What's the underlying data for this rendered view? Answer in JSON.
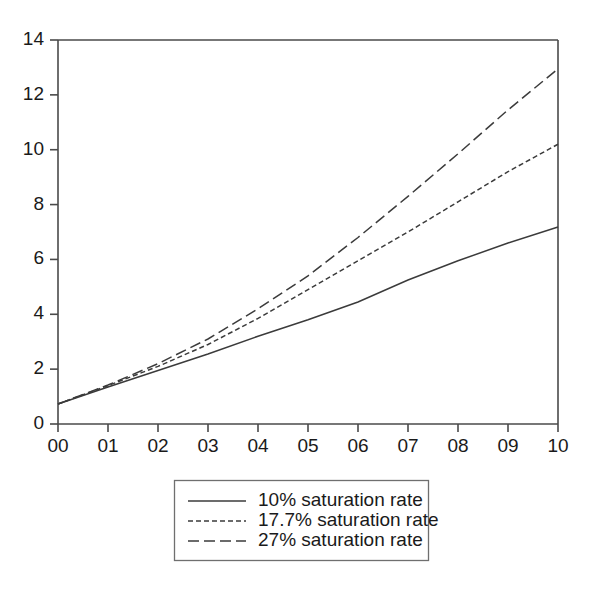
{
  "chart_data": {
    "type": "line",
    "title": "",
    "subtitle": "",
    "xlabel": "",
    "ylabel": "",
    "x": [
      0,
      1,
      2,
      3,
      4,
      5,
      6,
      7,
      8,
      9,
      10
    ],
    "xtick_labels": [
      "00",
      "01",
      "02",
      "03",
      "04",
      "05",
      "06",
      "07",
      "08",
      "09",
      "10"
    ],
    "ytick_labels": [
      "0",
      "2",
      "4",
      "6",
      "8",
      "10",
      "12",
      "14"
    ],
    "yticks": [
      0,
      2,
      4,
      6,
      8,
      10,
      12,
      14
    ],
    "xlim": [
      0,
      10
    ],
    "ylim": [
      0,
      14
    ],
    "grid": false,
    "legend_position": "below-center",
    "series": [
      {
        "name": "10% saturation rate",
        "style": "solid",
        "color": "#3b3b3b",
        "values": [
          0.73,
          1.35,
          1.95,
          2.55,
          3.2,
          3.8,
          4.45,
          5.25,
          5.95,
          6.6,
          7.18
        ]
      },
      {
        "name": "17.7% saturation rate",
        "style": "dotted",
        "color": "#3b3b3b",
        "values": [
          0.73,
          1.4,
          2.1,
          2.9,
          3.85,
          4.9,
          5.95,
          7.0,
          8.1,
          9.2,
          10.2
        ]
      },
      {
        "name": "27% saturation rate",
        "style": "dashed",
        "color": "#3b3b3b",
        "values": [
          0.73,
          1.42,
          2.2,
          3.1,
          4.2,
          5.4,
          6.8,
          8.3,
          9.85,
          11.45,
          12.95
        ]
      }
    ]
  },
  "legend": {
    "entries": [
      {
        "label": "10% saturation rate",
        "style": "solid"
      },
      {
        "label": "17.7% saturation rate",
        "style": "dotted"
      },
      {
        "label": "27% saturation rate",
        "style": "dashed"
      }
    ]
  },
  "axes": {
    "y_ticks": [
      "14",
      "12",
      "10",
      "8",
      "6",
      "4",
      "2",
      "0"
    ],
    "x_ticks": [
      "00",
      "01",
      "02",
      "03",
      "04",
      "05",
      "06",
      "07",
      "08",
      "09",
      "10"
    ]
  },
  "colors": {
    "line": "#3b3b3b",
    "axis": "#4a4a4a",
    "legend_border": "#6f6f6f",
    "background": "#ffffff",
    "text": "#1a1a1a"
  }
}
